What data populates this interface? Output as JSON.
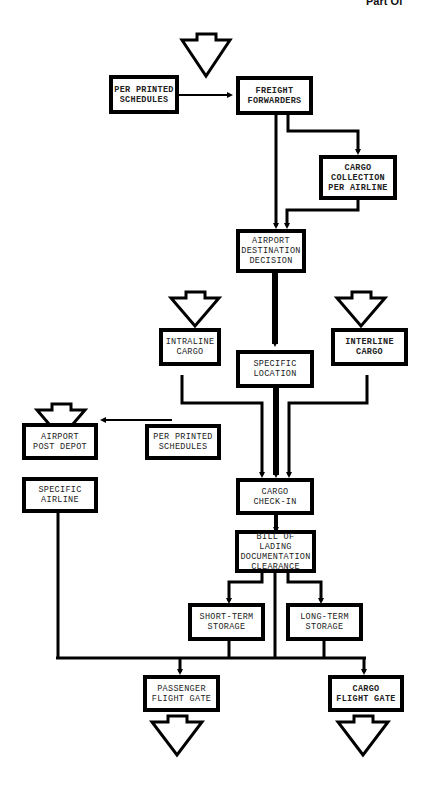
{
  "header": {
    "clipped_text": "Part Of"
  },
  "nodes": {
    "per_printed_schedules_1": "PER PRINTED\nSCHEDULES",
    "freight_forwarders": "FREIGHT\nFORWARDERS",
    "cargo_collection": "CARGO\nCOLLECTION\nPER AIRLINE",
    "airport_destination": "AIRPORT\nDESTINATION\nDECISION",
    "intraline_cargo": "INTRALINE\nCARGO",
    "specific_location": "SPECIFIC\nLOCATION",
    "interline_cargo": "INTERLINE\nCARGO",
    "airport_post_depot": "AIRPORT\nPOST DEPOT",
    "per_printed_schedules_2": "PER PRINTED\nSCHEDULES",
    "specific_airline": "SPECIFIC\nAIRLINE",
    "cargo_check_in": "CARGO\nCHECK-IN",
    "bill_of_lading": "BILL OF LADING\nDOCUMENTATION\nCLEARANCE",
    "short_term_storage": "SHORT-TERM\nSTORAGE",
    "long_term_storage": "LONG-TERM\nSTORAGE",
    "passenger_flight_gate": "PASSENGER\nFLIGHT GATE",
    "cargo_flight_gate": "CARGO\nFLIGHT GATE"
  },
  "terminals": [
    "entry-freight-forwarders",
    "entry-intraline-cargo",
    "entry-interline-cargo",
    "entry-airport-post-depot",
    "exit-passenger-flight-gate",
    "exit-cargo-flight-gate"
  ]
}
